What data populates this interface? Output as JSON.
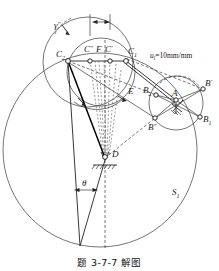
{
  "figure": {
    "caption": "题 3-7-7 解图",
    "scale_note": "u",
    "scale_note_sub": "l",
    "scale_note_value": "=10mm/mm",
    "background": "#ffffff",
    "ink": "#222222"
  },
  "labels": {
    "gamma_double_prime": "γ",
    "gamma_double_prime_mark": "″",
    "C2": "C",
    "C2_sub": "2",
    "C1": "C",
    "C1_sub": "1",
    "C_double_prime": "C",
    "C_double_prime_mark": "″",
    "C_prime": "C",
    "C_prime_mark": "′",
    "F": "F",
    "E": "E",
    "A": "A",
    "B_prime": "B",
    "B_prime_mark": "′",
    "B_double_prime": "B",
    "B_double_prime_mark": "″",
    "B1": "B",
    "B1_sub": "1",
    "B2": "B",
    "B2_sub": "2",
    "D": "D",
    "theta": "θ",
    "S1": "S",
    "S1_sub": "1"
  },
  "geometry": {
    "points": {
      "C2": [
        68,
        61
      ],
      "C_double_prime": [
        90,
        61
      ],
      "F": [
        99,
        61
      ],
      "C_prime": [
        110,
        61
      ],
      "C1": [
        126,
        61
      ],
      "A": [
        176,
        100
      ],
      "B_prime": [
        203,
        89
      ],
      "B1": [
        200,
        117
      ],
      "B_double_prime": [
        155,
        118
      ],
      "B2": [
        156,
        95
      ],
      "D": [
        105,
        160
      ],
      "E": [
        122,
        94
      ]
    },
    "circles": {
      "S1": {
        "cx": 100,
        "cy": 150,
        "r": 97
      },
      "upper_left": {
        "cx": 88,
        "cy": 62,
        "r": 45
      },
      "inner_upper": {
        "cx": 101,
        "cy": 72,
        "r": 34
      },
      "A_circle": {
        "cx": 176,
        "cy": 103,
        "r": 27
      }
    }
  }
}
